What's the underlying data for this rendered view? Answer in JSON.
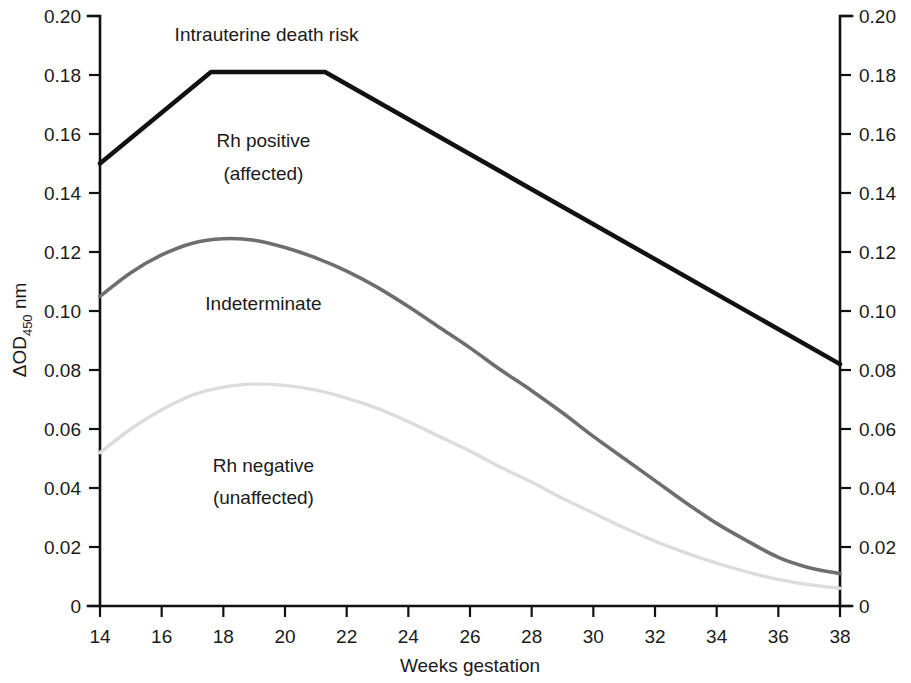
{
  "chart_data": {
    "type": "line",
    "title": "",
    "xlabel": "Weeks gestation",
    "ylabel": "ΔOD450 nm",
    "ylabel_main": "ΔOD",
    "ylabel_sub": "450",
    "ylabel_unit": " nm",
    "xlim": [
      14,
      38
    ],
    "ylim": [
      0,
      0.2
    ],
    "grid": false,
    "legend": "none",
    "x_ticks": [
      14,
      16,
      18,
      20,
      22,
      24,
      26,
      28,
      30,
      32,
      34,
      36,
      38
    ],
    "x_tick_labels": [
      "14",
      "16",
      "18",
      "20",
      "22",
      "24",
      "26",
      "28",
      "30",
      "32",
      "34",
      "36",
      "38"
    ],
    "y_ticks": [
      0,
      0.02,
      0.04,
      0.06,
      0.08,
      0.1,
      0.12,
      0.14,
      0.16,
      0.18,
      0.2
    ],
    "y_tick_labels": [
      "0",
      "0.02",
      "0.04",
      "0.06",
      "0.08",
      "0.10",
      "0.12",
      "0.14",
      "0.16",
      "0.18",
      "0.20"
    ],
    "right_axis_tick_labels": [
      "0",
      "0.02",
      "0.04",
      "0.06",
      "0.08",
      "0.10",
      "0.12",
      "0.14",
      "0.16",
      "0.18",
      "0.20"
    ],
    "series": [
      {
        "name": "Intrauterine death risk boundary",
        "color": "#111111",
        "width": 4.5,
        "shape": "polyline",
        "points": [
          [
            14,
            0.15
          ],
          [
            17.6,
            0.181
          ],
          [
            21.3,
            0.181
          ],
          [
            38,
            0.082
          ]
        ]
      },
      {
        "name": "Indeterminate boundary",
        "color": "#6e6e6e",
        "width": 3.6,
        "shape": "smooth",
        "points": [
          [
            14,
            0.105
          ],
          [
            15,
            0.113
          ],
          [
            16,
            0.119
          ],
          [
            17,
            0.123
          ],
          [
            18,
            0.1245
          ],
          [
            19,
            0.124
          ],
          [
            20,
            0.1215
          ],
          [
            21,
            0.118
          ],
          [
            22,
            0.1135
          ],
          [
            23,
            0.108
          ],
          [
            24,
            0.1015
          ],
          [
            25,
            0.0945
          ],
          [
            26,
            0.0875
          ],
          [
            27,
            0.08
          ],
          [
            28,
            0.073
          ],
          [
            29,
            0.0655
          ],
          [
            30,
            0.0575
          ],
          [
            31,
            0.05
          ],
          [
            32,
            0.0425
          ],
          [
            33,
            0.035
          ],
          [
            34,
            0.028
          ],
          [
            35,
            0.022
          ],
          [
            36,
            0.0165
          ],
          [
            37,
            0.013
          ],
          [
            38,
            0.011
          ]
        ]
      },
      {
        "name": "Rh negative (unaffected) boundary",
        "color": "#dcdcdc",
        "width": 3.4,
        "shape": "smooth",
        "points": [
          [
            14,
            0.052
          ],
          [
            15,
            0.06
          ],
          [
            16,
            0.0665
          ],
          [
            17,
            0.0715
          ],
          [
            18,
            0.0742
          ],
          [
            19,
            0.0752
          ],
          [
            20,
            0.0748
          ],
          [
            21,
            0.0732
          ],
          [
            22,
            0.0705
          ],
          [
            23,
            0.067
          ],
          [
            24,
            0.0625
          ],
          [
            25,
            0.0575
          ],
          [
            26,
            0.0525
          ],
          [
            27,
            0.047
          ],
          [
            28,
            0.042
          ],
          [
            29,
            0.0365
          ],
          [
            30,
            0.0315
          ],
          [
            31,
            0.0265
          ],
          [
            32,
            0.022
          ],
          [
            33,
            0.018
          ],
          [
            34,
            0.0145
          ],
          [
            35,
            0.0115
          ],
          [
            36,
            0.009
          ],
          [
            37,
            0.0072
          ],
          [
            38,
            0.006
          ]
        ]
      }
    ],
    "annotations": [
      {
        "text": "Intrauterine death risk",
        "x": 19.4,
        "y": 0.1915,
        "name": "annotation-intrauterine-death-risk"
      },
      {
        "text": "Rh positive",
        "x": 19.3,
        "y": 0.1555,
        "name": "annotation-rh-positive-line1"
      },
      {
        "text": "(affected)",
        "x": 19.3,
        "y": 0.1445,
        "name": "annotation-rh-positive-line2"
      },
      {
        "text": "Indeterminate",
        "x": 19.3,
        "y": 0.1005,
        "name": "annotation-indeterminate"
      },
      {
        "text": "Rh negative",
        "x": 19.3,
        "y": 0.0455,
        "name": "annotation-rh-negative-line1"
      },
      {
        "text": "(unaffected)",
        "x": 19.3,
        "y": 0.0345,
        "name": "annotation-rh-negative-line2"
      }
    ]
  }
}
